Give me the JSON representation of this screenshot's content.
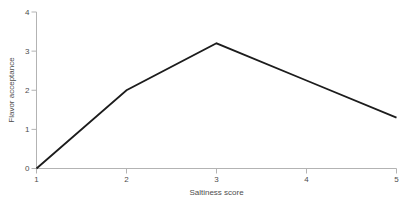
{
  "chart_data": {
    "type": "line",
    "title": "",
    "xlabel": "Saltiness score",
    "ylabel": "Flavor acceptance",
    "x": [
      1,
      2,
      3,
      4,
      5
    ],
    "series": [
      {
        "name": "Flavor acceptance",
        "values": [
          0,
          2.0,
          3.2,
          2.25,
          1.3
        ]
      }
    ],
    "xlim": [
      1,
      5
    ],
    "ylim": [
      0,
      4
    ],
    "x_ticks": [
      "1",
      "2",
      "3",
      "4",
      "5"
    ],
    "y_ticks": [
      "0",
      "1",
      "2",
      "3",
      "4"
    ],
    "grid": false,
    "legend": "none",
    "colors": {
      "line": "#1c1c1c",
      "axis": "#b3b3b3",
      "tick": "#b3b3b3",
      "tick_label": "#4d4d4d",
      "background": "#ffffff"
    }
  }
}
